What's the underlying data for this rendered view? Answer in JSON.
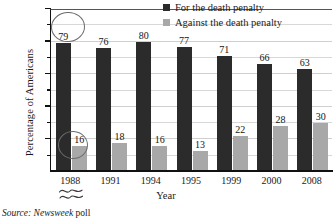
{
  "chart_data": {
    "type": "bar",
    "title": "",
    "xlabel": "Year",
    "ylabel": "Percentage of Americans",
    "categories": [
      "1988",
      "1991",
      "1994",
      "1995",
      "1999",
      "2000",
      "2008"
    ],
    "series": [
      {
        "name": "For the death penalty",
        "values": [
          79,
          76,
          80,
          77,
          71,
          66,
          63
        ],
        "color": "#2b2b2b"
      },
      {
        "name": "Against the death penalty",
        "values": [
          16,
          18,
          16,
          13,
          22,
          28,
          30
        ],
        "color": "#a8a8a8"
      }
    ],
    "ylim": [
      0,
      100
    ],
    "ytick_labels": [
      "20%",
      "40%",
      "60%",
      "80%",
      "100%"
    ],
    "ytick_values": [
      20,
      40,
      60,
      80,
      100
    ],
    "yminor_values": [
      10,
      30,
      50,
      70,
      90
    ],
    "grid": true,
    "legend_position": "top-right",
    "annotations": [
      {
        "name": "circled-value-79",
        "target_series": "For the death penalty",
        "target_category": "1988",
        "value": 79
      },
      {
        "name": "circled-value-16",
        "target_series": "Against the death penalty",
        "target_category": "1988",
        "value": 16
      }
    ],
    "axis_break": {
      "below_category": "1988",
      "symbol": "squiggle"
    }
  },
  "legend": {
    "items": [
      {
        "label": "For the death penalty",
        "swatch": "dark-square-swatch"
      },
      {
        "label": "Against the death penalty",
        "swatch": "gray-square-swatch"
      }
    ]
  },
  "source": {
    "prefix": "Source:",
    "publication": "Newsweek",
    "suffix": "poll"
  }
}
